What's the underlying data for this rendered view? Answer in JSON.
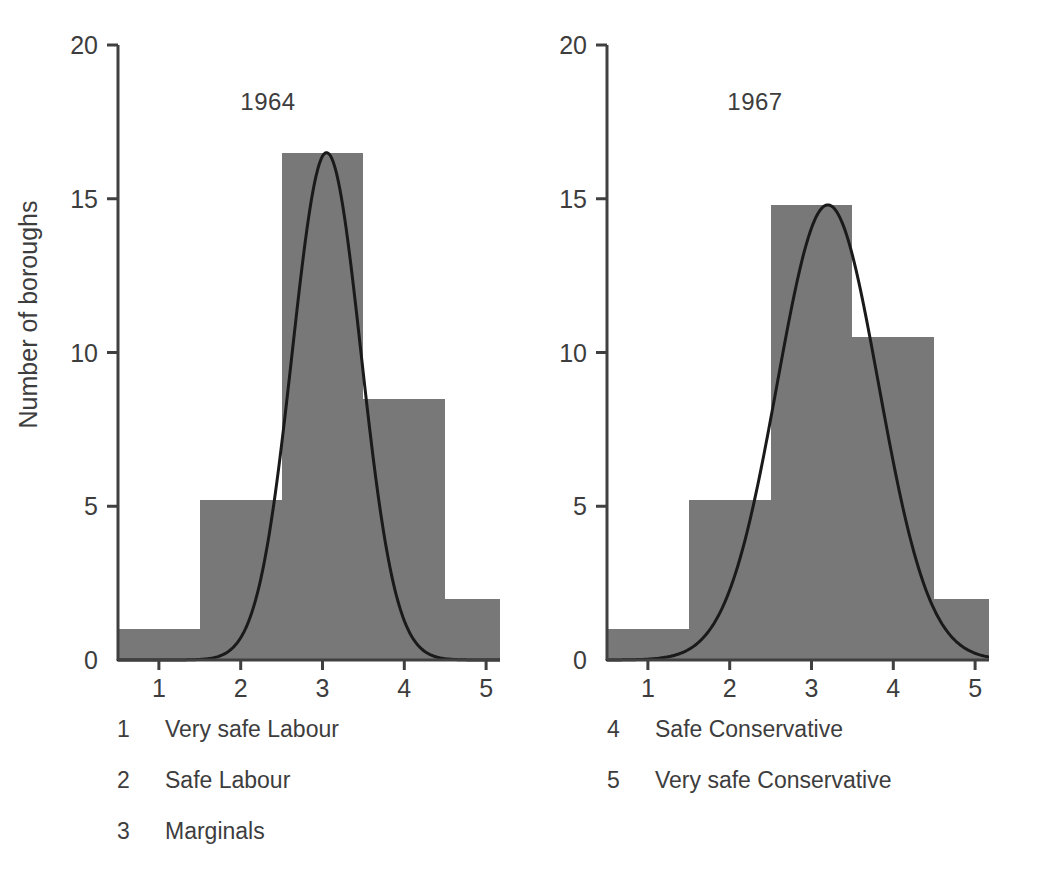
{
  "figure": {
    "ylabel": "Number of boroughs",
    "bar_color": "#787878",
    "axis_color": "#404040",
    "curve_color": "#1a1a1a",
    "text_color": "#3d3d3d"
  },
  "legend": {
    "left": [
      {
        "key": "1",
        "label": "Very safe Labour"
      },
      {
        "key": "2",
        "label": "Safe Labour"
      },
      {
        "key": "3",
        "label": "Marginals"
      }
    ],
    "right": [
      {
        "key": "4",
        "label": "Safe Conservative"
      },
      {
        "key": "5",
        "label": "Very safe Conservative"
      }
    ]
  },
  "chart_data": [
    {
      "type": "bar",
      "title": "1964",
      "xlabel": "",
      "ylabel": "Number of boroughs",
      "categories": [
        "1",
        "2",
        "3",
        "4",
        "5"
      ],
      "category_labels": [
        "Very safe Labour",
        "Safe Labour",
        "Marginals",
        "Safe Conservative",
        "Very safe Conservative"
      ],
      "values": [
        1,
        5.2,
        16.5,
        8.5,
        2
      ],
      "ylim": [
        0,
        20
      ],
      "yticks": [
        0,
        5,
        10,
        15,
        20
      ],
      "ytick_labels": [
        "0",
        "5",
        "10",
        "15",
        "20"
      ],
      "xticks": [
        1,
        2,
        3,
        4,
        5
      ],
      "xtick_labels": [
        "1",
        "2",
        "3",
        "4",
        "5"
      ],
      "grid": false,
      "legend_position": "below-figure",
      "overlay_curve": {
        "name": "fitted normal curve",
        "peak_x": 3.05,
        "peak_y": 16.5,
        "sigma": 0.42,
        "endpoints_y": 0
      }
    },
    {
      "type": "bar",
      "title": "1967",
      "xlabel": "",
      "ylabel": "Number of boroughs",
      "categories": [
        "1",
        "2",
        "3",
        "4",
        "5"
      ],
      "category_labels": [
        "Very safe Labour",
        "Safe Labour",
        "Marginals",
        "Safe Conservative",
        "Very safe Conservative"
      ],
      "values": [
        1,
        5.2,
        14.8,
        10.5,
        2
      ],
      "ylim": [
        0,
        20
      ],
      "yticks": [
        0,
        5,
        10,
        15,
        20
      ],
      "ytick_labels": [
        "0",
        "5",
        "10",
        "15",
        "20"
      ],
      "xticks": [
        1,
        2,
        3,
        4,
        5
      ],
      "xtick_labels": [
        "1",
        "2",
        "3",
        "4",
        "5"
      ],
      "grid": false,
      "legend_position": "below-figure",
      "overlay_curve": {
        "name": "fitted normal curve",
        "peak_x": 3.2,
        "peak_y": 14.8,
        "sigma": 0.62,
        "endpoints_y": 0
      }
    }
  ]
}
